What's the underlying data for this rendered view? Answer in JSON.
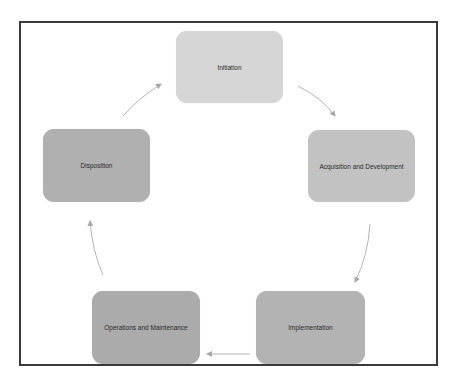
{
  "diagram": {
    "type": "cycle",
    "nodes": [
      {
        "id": "initiation",
        "label": "Initiation",
        "color": "#d6d6d6"
      },
      {
        "id": "acquisition",
        "label": "Acquisition and Development",
        "color": "#c2c2c2"
      },
      {
        "id": "implementation",
        "label": "Implementation",
        "color": "#b3b3b3"
      },
      {
        "id": "operations",
        "label": "Operations and Maintenance",
        "color": "#ababab"
      },
      {
        "id": "disposition",
        "label": "Disposition",
        "color": "#b0b0b0"
      }
    ],
    "edges": [
      {
        "from": "initiation",
        "to": "acquisition"
      },
      {
        "from": "acquisition",
        "to": "implementation"
      },
      {
        "from": "implementation",
        "to": "operations"
      },
      {
        "from": "operations",
        "to": "disposition"
      },
      {
        "from": "disposition",
        "to": "initiation"
      }
    ],
    "arrow_color": "#a8a8a8",
    "frame_color": "#3a3a3a"
  }
}
